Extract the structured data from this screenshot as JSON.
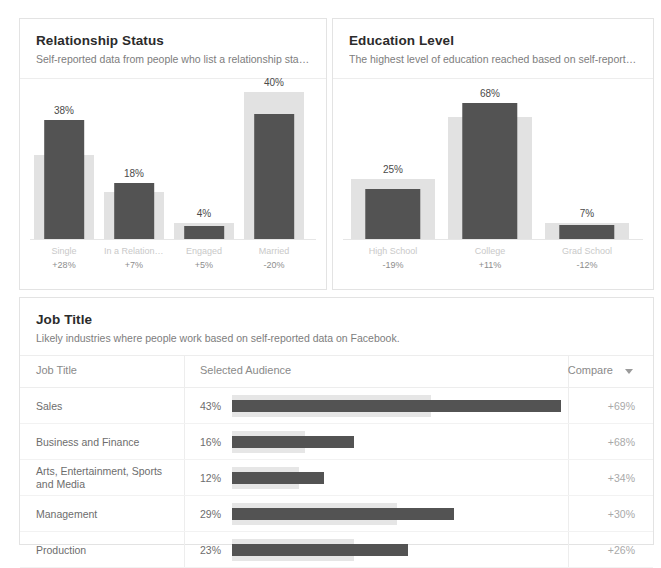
{
  "relationship_card": {
    "title": "Relationship Status",
    "subtitle": "Self-reported data from people who list a relationship status on F..."
  },
  "education_card": {
    "title": "Education Level",
    "subtitle": "The highest level of education reached based on self-reported da..."
  },
  "jobtitle_card": {
    "title": "Job Title",
    "subtitle": "Likely industries where people work based on self-reported data on Facebook.",
    "columns": {
      "job_title": "Job Title",
      "selected_audience": "Selected Audience",
      "compare": "Compare",
      "sort_icon": "chevron-down-icon"
    },
    "rows": [
      {
        "name": "Sales",
        "value": "43%",
        "compare": "+69%"
      },
      {
        "name": "Business and Finance",
        "value": "16%",
        "compare": "+68%"
      },
      {
        "name": "Arts, Entertainment, Sports and Media",
        "value": "12%",
        "compare": "+34%"
      },
      {
        "name": "Management",
        "value": "29%",
        "compare": "+30%"
      },
      {
        "name": "Production",
        "value": "23%",
        "compare": "+26%"
      }
    ]
  },
  "colors": {
    "selected_bar": "#535353",
    "compare_bar": "#e2e2e2",
    "title_text": "#2b2b2b",
    "muted_text": "#7d7d7d"
  },
  "chart_data": [
    {
      "type": "bar",
      "title": "Relationship Status",
      "subtitle": "Self-reported data from people who list a relationship status on F...",
      "categories": [
        "Single",
        "In a Relationship",
        "Engaged",
        "Married"
      ],
      "series": [
        {
          "name": "Selected Audience",
          "values": [
            38,
            18,
            4,
            40
          ]
        },
        {
          "name": "Compare",
          "values": [
            27,
            15,
            5,
            47
          ]
        }
      ],
      "data_labels": [
        "38%",
        "18%",
        "4%",
        "40%"
      ],
      "compare_deltas": [
        "+28%",
        "+7%",
        "+5%",
        "-20%"
      ],
      "xlabel": "",
      "ylabel": "",
      "ylim": [
        0,
        48
      ],
      "grid": false,
      "legend": "none"
    },
    {
      "type": "bar",
      "title": "Education Level",
      "subtitle": "The highest level of education reached based on self-reported da...",
      "categories": [
        "High School",
        "College",
        "Grad School"
      ],
      "series": [
        {
          "name": "Selected Audience",
          "values": [
            25,
            68,
            7
          ]
        },
        {
          "name": "Compare",
          "values": [
            30,
            61,
            8
          ]
        }
      ],
      "data_labels": [
        "25%",
        "68%",
        "7%"
      ],
      "compare_deltas": [
        "-19%",
        "+11%",
        "-12%"
      ],
      "xlabel": "",
      "ylabel": "",
      "ylim": [
        0,
        75
      ],
      "grid": false,
      "legend": "none"
    },
    {
      "type": "bar",
      "title": "Job Title",
      "subtitle": "Likely industries where people work based on self-reported data on Facebook.",
      "orientation": "horizontal",
      "categories": [
        "Sales",
        "Business and Finance",
        "Arts, Entertainment, Sports and Media",
        "Management",
        "Production"
      ],
      "series": [
        {
          "name": "Selected Audience",
          "values": [
            43,
            16,
            12,
            29,
            23
          ]
        },
        {
          "name": "Compare",
          "values": [
            26,
            9.5,
            8.8,
            21.5,
            16
          ]
        }
      ],
      "data_labels": [
        "43%",
        "16%",
        "12%",
        "29%",
        "23%"
      ],
      "compare_deltas": [
        "+69%",
        "+68%",
        "+34%",
        "+30%",
        "+26%"
      ],
      "xlabel": "",
      "ylabel": "",
      "grid": false,
      "legend": "none"
    }
  ]
}
